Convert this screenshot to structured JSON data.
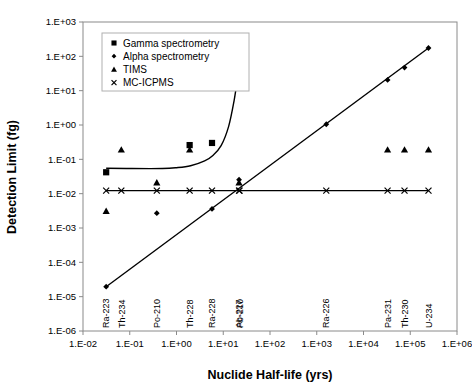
{
  "chart_data": {
    "type": "scatter",
    "title": "",
    "xlabel": "Nuclide Half-life (yrs)",
    "ylabel": "Detection Limit (fg)",
    "xscale": "log",
    "yscale": "log",
    "xlim": [
      0.01,
      1000000
    ],
    "ylim": [
      1e-06,
      1000
    ],
    "grid": false,
    "legend_position": "top-left",
    "xticklabels": [
      "1.E-02",
      "1.E-01",
      "1.E+00",
      "1.E+01",
      "1.E+02",
      "1.E+03",
      "1.E+04",
      "1.E+05",
      "1.E+06"
    ],
    "xtickvalues": [
      0.01,
      0.1,
      1,
      10,
      100,
      1000,
      10000,
      100000,
      1000000
    ],
    "yticklabels": [
      "1.E+03",
      "1.E+02",
      "1.E+01",
      "1.E+00",
      "1.E-01",
      "1.E-02",
      "1.E-03",
      "1.E-04",
      "1.E-05",
      "1.E-06"
    ],
    "ytickvalues": [
      1000,
      100,
      10,
      1,
      0.1,
      0.01,
      0.001,
      0.0001,
      1e-05,
      1e-06
    ],
    "nuclide_labels": [
      {
        "name": "Ra-223",
        "x": 0.0313
      },
      {
        "name": "Th-234",
        "x": 0.066
      },
      {
        "name": "Po-210",
        "x": 0.379
      },
      {
        "name": "Th-228",
        "x": 1.91
      },
      {
        "name": "Ra-228",
        "x": 5.75
      },
      {
        "name": "Ac-227",
        "x": 21.77
      },
      {
        "name": "Pb-210",
        "x": 22.3
      },
      {
        "name": "Ra-226",
        "x": 1600
      },
      {
        "name": "Pa-231",
        "x": 32760
      },
      {
        "name": "Th-230",
        "x": 75400
      },
      {
        "name": "U-234",
        "x": 245500
      }
    ],
    "series": [
      {
        "name": "Gamma spectrometry",
        "marker": "square",
        "points": [
          {
            "x": 0.0313,
            "y": 0.042
          },
          {
            "x": 1.91,
            "y": 0.26
          },
          {
            "x": 5.75,
            "y": 0.3
          },
          {
            "x": 21.77,
            "y": 45
          },
          {
            "x": 22.3,
            "y": 110
          }
        ],
        "trend": [
          {
            "x": 0.0313,
            "y": 0.055
          },
          {
            "x": 0.1,
            "y": 0.054
          },
          {
            "x": 0.5,
            "y": 0.054
          },
          {
            "x": 1.0,
            "y": 0.057
          },
          {
            "x": 2.0,
            "y": 0.065
          },
          {
            "x": 4.0,
            "y": 0.09
          },
          {
            "x": 6.0,
            "y": 0.13
          },
          {
            "x": 9.0,
            "y": 0.25
          },
          {
            "x": 13.0,
            "y": 0.9
          },
          {
            "x": 17.0,
            "y": 5.0
          },
          {
            "x": 20.0,
            "y": 22.0
          },
          {
            "x": 21.5,
            "y": 55.0
          }
        ]
      },
      {
        "name": "Alpha spectrometry",
        "marker": "diamond",
        "points": [
          {
            "x": 0.0313,
            "y": 1.95e-05
          },
          {
            "x": 0.379,
            "y": 0.0027
          },
          {
            "x": 5.75,
            "y": 0.0036
          },
          {
            "x": 21.77,
            "y": 0.0255
          },
          {
            "x": 1600,
            "y": 1.05
          },
          {
            "x": 32760,
            "y": 20.5
          },
          {
            "x": 75400,
            "y": 47.0
          },
          {
            "x": 245500,
            "y": 175.0
          }
        ],
        "trend": [
          {
            "x": 0.0313,
            "y": 1.95e-05
          },
          {
            "x": 245500,
            "y": 175.0
          }
        ]
      },
      {
        "name": "TIMS",
        "marker": "triangle",
        "points": [
          {
            "x": 0.0313,
            "y": 0.0031
          },
          {
            "x": 0.066,
            "y": 0.19
          },
          {
            "x": 0.379,
            "y": 0.021
          },
          {
            "x": 1.91,
            "y": 0.19
          },
          {
            "x": 21.77,
            "y": 0.021
          },
          {
            "x": 32760,
            "y": 0.19
          },
          {
            "x": 75400,
            "y": 0.19
          },
          {
            "x": 245500,
            "y": 0.19
          }
        ],
        "trend": []
      },
      {
        "name": "MC-ICPMS",
        "marker": "cross",
        "points": [
          {
            "x": 0.0313,
            "y": 0.0123
          },
          {
            "x": 0.066,
            "y": 0.0123
          },
          {
            "x": 0.379,
            "y": 0.0123
          },
          {
            "x": 1.91,
            "y": 0.0123
          },
          {
            "x": 5.75,
            "y": 0.0123
          },
          {
            "x": 21.77,
            "y": 0.0123
          },
          {
            "x": 22.3,
            "y": 0.0123
          },
          {
            "x": 1600,
            "y": 0.0123
          },
          {
            "x": 32760,
            "y": 0.0123
          },
          {
            "x": 75400,
            "y": 0.0123
          },
          {
            "x": 245500,
            "y": 0.0123
          }
        ],
        "trend": [
          {
            "x": 0.0313,
            "y": 0.0123
          },
          {
            "x": 245500,
            "y": 0.0123
          }
        ]
      }
    ],
    "legend": [
      {
        "label": "Gamma spectrometry",
        "marker": "square"
      },
      {
        "label": "Alpha spectrometry",
        "marker": "diamond"
      },
      {
        "label": "TIMS",
        "marker": "triangle"
      },
      {
        "label": "MC-ICPMS",
        "marker": "cross"
      }
    ]
  }
}
